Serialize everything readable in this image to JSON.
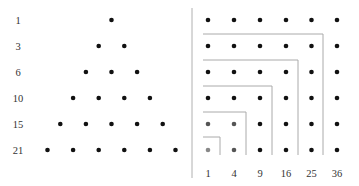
{
  "triangular": {
    "labels": [
      "1",
      "3",
      "6",
      "10",
      "15",
      "21"
    ],
    "counts": [
      1,
      2,
      3,
      4,
      5,
      6
    ]
  },
  "square": {
    "labels": [
      "1",
      "4",
      "9",
      "16",
      "25",
      "36"
    ],
    "grid_size": 6
  },
  "colors": {
    "dot": "#111111",
    "dot_light": "#777777",
    "line": "#aaaaaa",
    "label": "#333333"
  }
}
